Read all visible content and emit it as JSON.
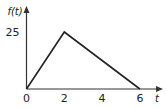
{
  "chart_data": {
    "type": "line",
    "title": "",
    "xlabel": "t",
    "ylabel": "f(t)",
    "x": [
      0,
      2,
      6
    ],
    "series": [
      {
        "name": "f(t)",
        "values": [
          0,
          25,
          0
        ]
      }
    ],
    "xticks": [
      0,
      2,
      4,
      6
    ],
    "xtick_labels": [
      "0",
      "2",
      "4",
      "6"
    ],
    "yticks": [
      25
    ],
    "ytick_labels": [
      "25"
    ],
    "xlim": [
      0,
      7.2
    ],
    "ylim": [
      0,
      28.5
    ],
    "grid": false,
    "legend": "none"
  }
}
